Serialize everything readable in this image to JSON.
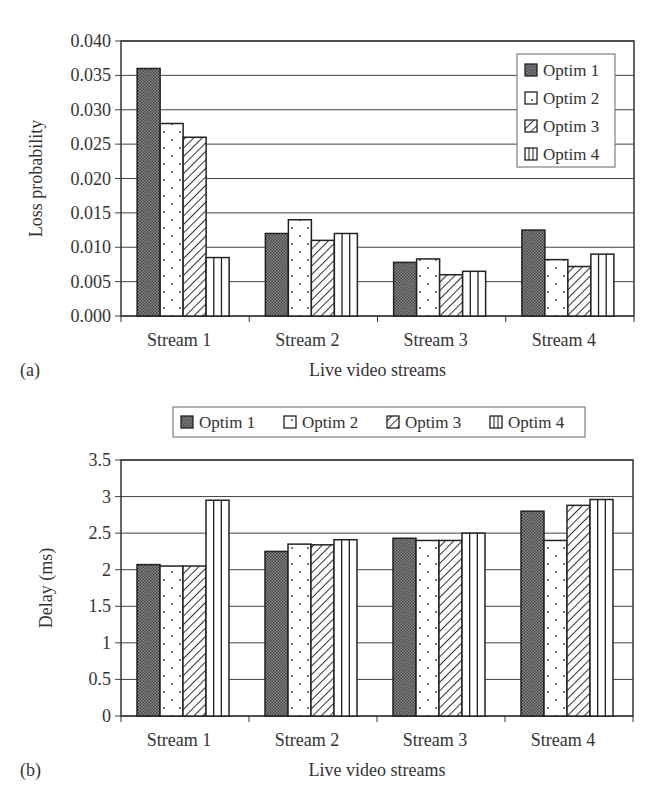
{
  "chart_data": [
    {
      "id": "a",
      "type": "bar",
      "panel_label": "(a)",
      "title": "",
      "xlabel": "Live video streams",
      "ylabel": "Loss probability",
      "categories": [
        "Stream 1",
        "Stream 2",
        "Stream 3",
        "Stream 4"
      ],
      "series": [
        {
          "name": "Optim 1",
          "pattern": "dense-crosshatch",
          "values": [
            0.036,
            0.012,
            0.0078,
            0.0125
          ]
        },
        {
          "name": "Optim 2",
          "pattern": "dots",
          "values": [
            0.028,
            0.014,
            0.0083,
            0.0082
          ]
        },
        {
          "name": "Optim 3",
          "pattern": "diagonal-lines",
          "values": [
            0.026,
            0.011,
            0.006,
            0.0072
          ]
        },
        {
          "name": "Optim 4",
          "pattern": "vertical-lines",
          "values": [
            0.0085,
            0.012,
            0.0065,
            0.009
          ]
        }
      ],
      "ylim": [
        0,
        0.04
      ],
      "yticks": [
        "0.000",
        "0.005",
        "0.010",
        "0.015",
        "0.020",
        "0.025",
        "0.030",
        "0.035",
        "0.040"
      ],
      "grid": true,
      "legend_position": "upper-right-inside-vertical"
    },
    {
      "id": "b",
      "type": "bar",
      "panel_label": "(b)",
      "title": "",
      "xlabel": "Live video streams",
      "ylabel": "Delay (ms)",
      "categories": [
        "Stream 1",
        "Stream 2",
        "Stream 3",
        "Stream 4"
      ],
      "series": [
        {
          "name": "Optim 1",
          "pattern": "dense-crosshatch",
          "values": [
            2.07,
            2.25,
            2.43,
            2.8
          ]
        },
        {
          "name": "Optim 2",
          "pattern": "dots",
          "values": [
            2.05,
            2.35,
            2.4,
            2.4
          ]
        },
        {
          "name": "Optim 3",
          "pattern": "diagonal-lines",
          "values": [
            2.05,
            2.34,
            2.4,
            2.88
          ]
        },
        {
          "name": "Optim 4",
          "pattern": "vertical-lines",
          "values": [
            2.95,
            2.41,
            2.5,
            2.96
          ]
        }
      ],
      "ylim": [
        0,
        3.5
      ],
      "yticks": [
        "0",
        "0.5",
        "1",
        "1.5",
        "2",
        "2.5",
        "3",
        "3.5"
      ],
      "grid": true,
      "legend_position": "top-outside-horizontal"
    }
  ]
}
